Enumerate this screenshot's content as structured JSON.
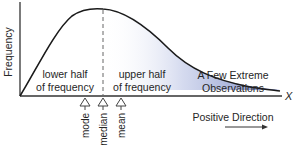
{
  "figure": {
    "y_axis_label": "Frequency",
    "x_axis_label": "X",
    "direction_label": "Positive Direction",
    "lower_half_label": [
      "lower half",
      "of frequency"
    ],
    "upper_half_label": [
      "upper half",
      "of frequency"
    ],
    "tail_label": [
      "A Few Extreme",
      "Observations"
    ],
    "markers": [
      {
        "name": "mode",
        "label": "mode"
      },
      {
        "name": "median",
        "label": "median"
      },
      {
        "name": "mean",
        "label": "mean"
      }
    ],
    "colors": {
      "curve": "#1a1a1a",
      "axis": "#333333",
      "median_line": "#666666",
      "tail_shade": "#6f7fc0",
      "marker_arrow": "#444444"
    }
  }
}
